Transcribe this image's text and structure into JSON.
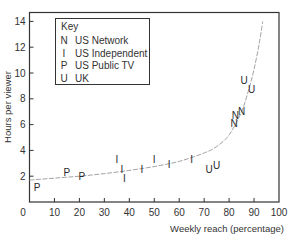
{
  "chart_data": {
    "type": "scatter",
    "title": "",
    "xlabel": "Weekly reach (percentage)",
    "ylabel": "Hours per viewer",
    "xlim": [
      0,
      100
    ],
    "ylim": [
      0,
      15
    ],
    "xticks": [
      0,
      10,
      20,
      30,
      40,
      50,
      60,
      70,
      80,
      90,
      100
    ],
    "yticks": [
      2,
      4,
      6,
      8,
      10,
      12,
      14
    ],
    "grid": false,
    "legend": {
      "title": "Key",
      "position": "upper left",
      "entries": [
        {
          "symbol": "N",
          "label": "US Network"
        },
        {
          "symbol": "I",
          "label": "US Independent"
        },
        {
          "symbol": "P",
          "label": "US Public TV"
        },
        {
          "symbol": "U",
          "label": "UK"
        }
      ]
    },
    "series": [
      {
        "name": "US Network",
        "symbol": "N",
        "points": [
          [
            82,
            6.1
          ],
          [
            82.5,
            6.7
          ],
          [
            85,
            7.0
          ]
        ]
      },
      {
        "name": "US Independent",
        "symbol": "I",
        "points": [
          [
            35,
            3.3
          ],
          [
            37,
            2.5
          ],
          [
            38,
            1.8
          ],
          [
            45,
            2.5
          ],
          [
            50,
            3.3
          ],
          [
            56,
            2.9
          ],
          [
            65,
            3.3
          ]
        ]
      },
      {
        "name": "US Public TV",
        "symbol": "P",
        "points": [
          [
            3,
            1.1
          ],
          [
            15,
            2.3
          ],
          [
            21,
            2.0
          ]
        ]
      },
      {
        "name": "UK",
        "symbol": "U",
        "points": [
          [
            72,
            2.5
          ],
          [
            75,
            2.8
          ],
          [
            86,
            9.4
          ],
          [
            89,
            8.7
          ]
        ]
      }
    ],
    "fitted_curve": {
      "description": "dashed fitted trend curve rising steeply near full reach",
      "points": [
        [
          0,
          1.7
        ],
        [
          10,
          1.85
        ],
        [
          20,
          2.0
        ],
        [
          30,
          2.2
        ],
        [
          40,
          2.45
        ],
        [
          50,
          2.75
        ],
        [
          60,
          3.15
        ],
        [
          70,
          3.8
        ],
        [
          75,
          4.3
        ],
        [
          80,
          5.2
        ],
        [
          85,
          7.0
        ],
        [
          88,
          8.8
        ],
        [
          90,
          10.3
        ],
        [
          92,
          12.2
        ],
        [
          93.5,
          14.0
        ]
      ]
    }
  }
}
